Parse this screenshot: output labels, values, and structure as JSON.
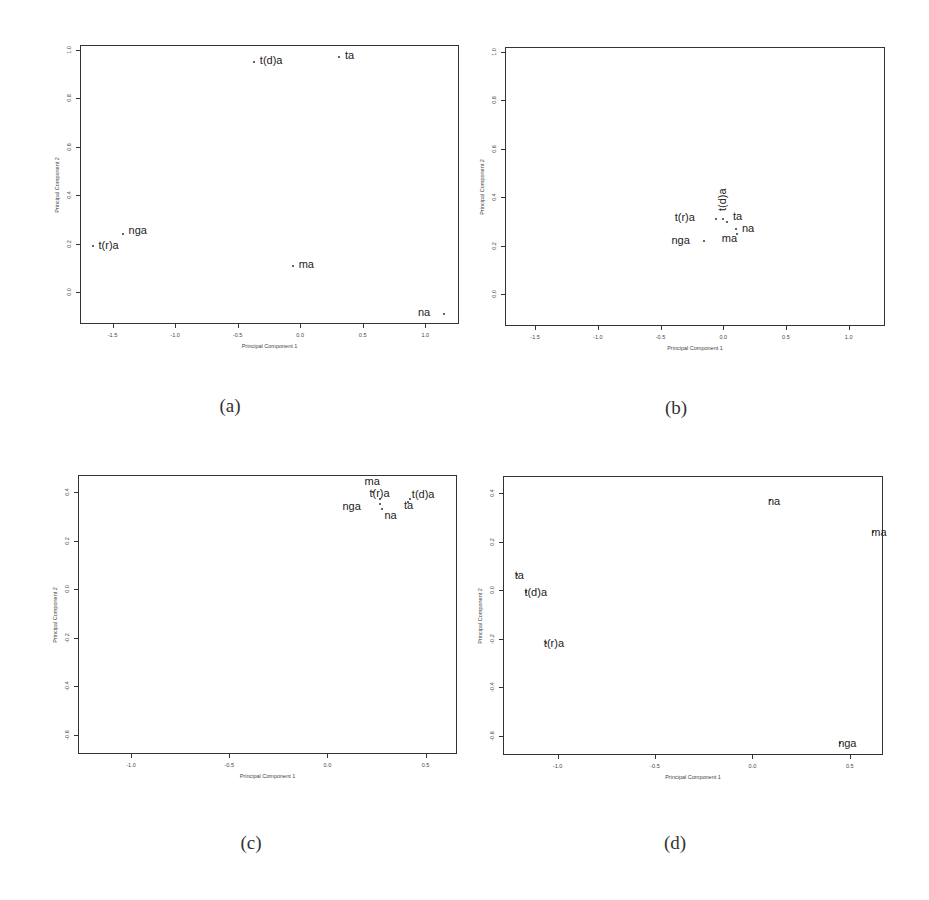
{
  "chart_data": [
    {
      "type": "scatter",
      "panel": "a",
      "caption": "(a)",
      "xlabel": "Principal Component 1",
      "ylabel": "Principal Component 2",
      "xlim": [
        -1.76,
        1.27
      ],
      "ylim": [
        -0.13,
        1.02
      ],
      "xticks": [
        "-1.5",
        "-1.0",
        "-0.5",
        "0.0",
        "0.5",
        "1.0"
      ],
      "yticks": [
        "0.0",
        "0.2",
        "0.4",
        "0.6",
        "0.8",
        "1.0"
      ],
      "grid": false,
      "points": [
        {
          "label": "t(d)a",
          "x": -0.37,
          "y": 0.95
        },
        {
          "label": "ta",
          "x": 0.31,
          "y": 0.97
        },
        {
          "label": "nga",
          "x": -1.42,
          "y": 0.24
        },
        {
          "label": "t(r)a",
          "x": -1.66,
          "y": 0.19
        },
        {
          "label": "ma",
          "x": -0.06,
          "y": 0.11
        },
        {
          "label": "na",
          "x": 1.15,
          "y": -0.09
        }
      ]
    },
    {
      "type": "scatter",
      "panel": "b",
      "caption": "(b)",
      "xlabel": "Principal Component 1",
      "ylabel": "Principal Component 2",
      "xlim": [
        -1.74,
        1.29
      ],
      "ylim": [
        -0.13,
        1.02
      ],
      "xticks": [
        "-1.5",
        "-1.0",
        "-0.5",
        "0.0",
        "0.5",
        "1.0"
      ],
      "yticks": [
        "0.0",
        "0.2",
        "0.4",
        "0.6",
        "0.8",
        "1.0"
      ],
      "grid": false,
      "points": [
        {
          "label": "t(r)a",
          "x": -0.06,
          "y": 0.31
        },
        {
          "label": "t(d)a",
          "x": 0.0,
          "y": 0.31
        },
        {
          "label": "ta",
          "x": 0.03,
          "y": 0.3
        },
        {
          "label": "na",
          "x": 0.11,
          "y": 0.25
        },
        {
          "label": "ma",
          "x": 0.1,
          "y": 0.27
        },
        {
          "label": "nga",
          "x": -0.15,
          "y": 0.22
        }
      ]
    },
    {
      "type": "scatter",
      "panel": "c",
      "caption": "(c)",
      "xlabel": "Principal Component 1",
      "ylabel": "Principal Component 2",
      "xlim": [
        -1.27,
        0.66
      ],
      "ylim": [
        -0.68,
        0.47
      ],
      "xticks": [
        "-1.0",
        "-0.5",
        "0.0",
        "0.5"
      ],
      "yticks": [
        "-0.6",
        "-0.4",
        "-0.2",
        "0.0",
        "0.2",
        "0.4"
      ],
      "grid": false,
      "points": [
        {
          "label": "ma",
          "x": 0.23,
          "y": 0.4
        },
        {
          "label": "t(r)a",
          "x": 0.27,
          "y": 0.37
        },
        {
          "label": "nga",
          "x": 0.27,
          "y": 0.35
        },
        {
          "label": "na",
          "x": 0.28,
          "y": 0.33
        },
        {
          "label": "ta",
          "x": 0.41,
          "y": 0.36
        },
        {
          "label": "t(d)a",
          "x": 0.42,
          "y": 0.37
        }
      ]
    },
    {
      "type": "scatter",
      "panel": "d",
      "caption": "(d)",
      "xlabel": "Principal Component 1",
      "ylabel": "Principal Component 2",
      "xlim": [
        -1.28,
        0.67
      ],
      "ylim": [
        -0.68,
        0.47
      ],
      "xticks": [
        "-1.0",
        "-0.5",
        "0.0",
        "0.5"
      ],
      "yticks": [
        "-0.6",
        "-0.4",
        "-0.2",
        "0.0",
        "0.2",
        "0.4"
      ],
      "grid": false,
      "points": [
        {
          "label": "na",
          "x": 0.09,
          "y": 0.37
        },
        {
          "label": "ma",
          "x": 0.62,
          "y": 0.24
        },
        {
          "label": "ta",
          "x": -1.21,
          "y": 0.06
        },
        {
          "label": "t(d)a",
          "x": -1.16,
          "y": -0.01
        },
        {
          "label": "t(r)a",
          "x": -1.06,
          "y": -0.22
        },
        {
          "label": "nga",
          "x": 0.45,
          "y": -0.63
        }
      ]
    }
  ]
}
